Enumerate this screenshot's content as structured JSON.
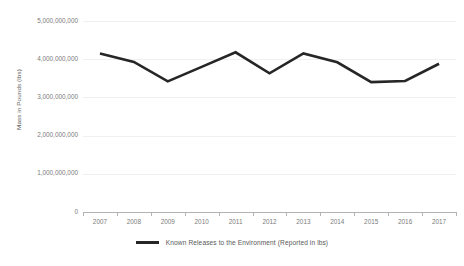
{
  "chart_data": {
    "type": "line",
    "title": "",
    "xlabel": "",
    "ylabel": "Mass in Pounds (lbs)",
    "categories": [
      "2007",
      "2008",
      "2009",
      "2010",
      "2011",
      "2012",
      "2013",
      "2014",
      "2015",
      "2016",
      "2017"
    ],
    "series": [
      {
        "name": "Known Releases to the Environment (Reported in lbs)",
        "color": "#262626",
        "values": [
          4150000000,
          3930000000,
          3420000000,
          3800000000,
          4180000000,
          3630000000,
          4150000000,
          3920000000,
          3400000000,
          3430000000,
          3880000000
        ]
      }
    ],
    "ylim": [
      0,
      5000000000
    ],
    "y_ticks": [
      {
        "value": 5000000000,
        "label": "5,000,000,000"
      },
      {
        "value": 4000000000,
        "label": "4,000,000,000"
      },
      {
        "value": 3000000000,
        "label": "3,000,000,000"
      },
      {
        "value": 2000000000,
        "label": "2,000,000,000"
      },
      {
        "value": 1000000000,
        "label": "1,000,000,000"
      },
      {
        "value": 0,
        "label": "0"
      }
    ],
    "grid": true,
    "legend_position": "bottom",
    "colors": {
      "line": "#262626",
      "gridline": "#f0f0f0",
      "axis": "#b3b3b3",
      "tick_text": "#7b7b7b",
      "title_text": "#595959",
      "background": "#ffffff"
    }
  },
  "legend": {
    "entries": [
      {
        "label": "Known Releases to the Environment (Reported in lbs)",
        "color": "#262626"
      }
    ]
  }
}
